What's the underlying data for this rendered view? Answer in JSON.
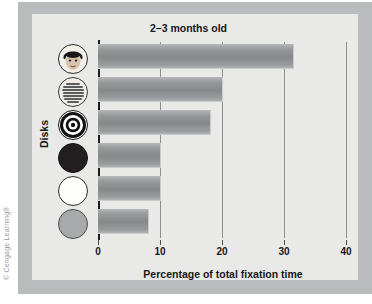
{
  "figure": {
    "copyright": "© Cengage Learning®",
    "frame_color": "#b9bbbd",
    "panel_color": "#e9e9e7",
    "bar_color": "#8d8f91",
    "axis_color": "#1d1e20"
  },
  "chart_data": {
    "type": "bar",
    "orientation": "horizontal",
    "title": "2–3 months old",
    "xlabel": "Percentage of total fixation time",
    "ylabel": "Disks",
    "xlim": [
      0,
      40
    ],
    "xticks": [
      0,
      10,
      20,
      30,
      40
    ],
    "xtick_labels": [
      "0",
      "10",
      "20",
      "30",
      "40"
    ],
    "grid": true,
    "legend": "none",
    "categories": [
      "face disk",
      "printed text disk",
      "bullseye disk",
      "solid black disk",
      "white disk",
      "gray disk"
    ],
    "values": [
      31.5,
      20,
      18,
      10,
      10,
      8
    ],
    "series": [
      {
        "name": "2–3 months old",
        "values": [
          31.5,
          20,
          18,
          10,
          10,
          8
        ]
      }
    ]
  },
  "disks": [
    {
      "name": "disk-face",
      "label": "face disk"
    },
    {
      "name": "disk-printed-text",
      "label": "printed text disk"
    },
    {
      "name": "disk-bullseye",
      "label": "bullseye disk"
    },
    {
      "name": "disk-solid-black",
      "label": "solid black disk"
    },
    {
      "name": "disk-white",
      "label": "white disk"
    },
    {
      "name": "disk-gray",
      "label": "gray disk"
    }
  ]
}
